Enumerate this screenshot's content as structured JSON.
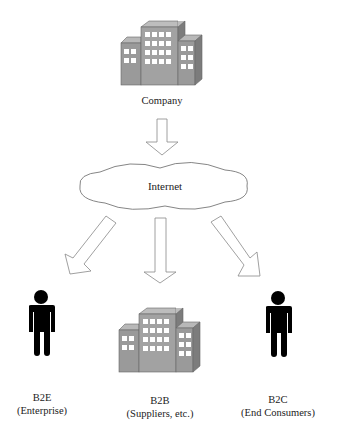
{
  "top": {
    "label": "Company",
    "icon": "building-icon"
  },
  "network": {
    "label": "Internet",
    "icon": "cloud-icon"
  },
  "targets": [
    {
      "title": "B2E",
      "subtitle": "(Enterprise)",
      "icon": "person-icon"
    },
    {
      "title": "B2B",
      "subtitle": "(Suppliers, etc.)",
      "icon": "building-icon"
    },
    {
      "title": "B2C",
      "subtitle": "(End Consumers)",
      "icon": "person-icon"
    }
  ],
  "colors": {
    "building_face": "#9a9a9a",
    "building_dark": "#7c7c7c",
    "building_top": "#b8b8b8",
    "window": "#ffffff",
    "person": "#000000",
    "outline": "#777777"
  }
}
